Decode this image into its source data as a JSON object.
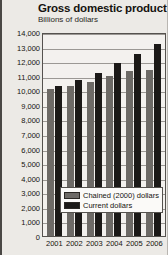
{
  "chart_data": {
    "type": "bar",
    "title": "Gross domestic product",
    "subtitle": "Billions of dollars",
    "xlabel": "",
    "ylabel": "Billions of dollars",
    "categories": [
      "2001",
      "2002",
      "2003",
      "2004",
      "2005",
      "2006"
    ],
    "series": [
      {
        "name": "Chained (2000) dollars",
        "color": "#6d6a66",
        "values": [
          10100,
          10300,
          10600,
          11000,
          11300,
          11400
        ]
      },
      {
        "name": "Current dollars",
        "color": "#1b1917",
        "values": [
          10300,
          10700,
          11200,
          11900,
          12500,
          13200
        ]
      }
    ],
    "ylim": [
      0,
      14000
    ],
    "yticks": [
      "14,000",
      "13,000",
      "12,000",
      "11,000",
      "10,000",
      "9,000",
      "8,000",
      "7,000",
      "6,000",
      "5,000",
      "4,000",
      "3,000",
      "2,000",
      "1,000",
      "0"
    ],
    "ytick_values": [
      14000,
      13000,
      12000,
      11000,
      10000,
      9000,
      8000,
      7000,
      6000,
      5000,
      4000,
      3000,
      2000,
      1000,
      0
    ],
    "grid": true,
    "legend_position": "bottom-right-inside"
  },
  "legend": {
    "items": [
      {
        "label": "Chained (2000) dollars",
        "swatch": "chained"
      },
      {
        "label": "Current dollars",
        "swatch": "current"
      }
    ]
  }
}
